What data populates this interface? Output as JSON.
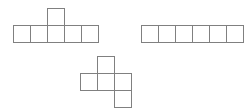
{
  "figure": {
    "title": "",
    "background_color": "#ffffff",
    "stroke_color": "#808080",
    "fill_color": "#ffffff",
    "stroke_width_px": 1,
    "cell_size_px": 17,
    "canvas": {
      "width": 249,
      "height": 112
    },
    "shapes": [
      {
        "id": "shape-1",
        "name": "five-in-a-row-with-one-on-top-of-center",
        "square_count": 6,
        "origin": {
          "x": 13,
          "y": 8
        },
        "grid_cols": 5,
        "grid_rows": 2,
        "cells": [
          {
            "col": 2,
            "row": 0
          },
          {
            "col": 0,
            "row": 1
          },
          {
            "col": 1,
            "row": 1
          },
          {
            "col": 2,
            "row": 1
          },
          {
            "col": 3,
            "row": 1
          },
          {
            "col": 4,
            "row": 1
          }
        ]
      },
      {
        "id": "shape-2",
        "name": "six-in-a-straight-row",
        "square_count": 6,
        "origin": {
          "x": 141,
          "y": 25
        },
        "grid_cols": 6,
        "grid_rows": 1,
        "cells": [
          {
            "col": 0,
            "row": 0
          },
          {
            "col": 1,
            "row": 0
          },
          {
            "col": 2,
            "row": 0
          },
          {
            "col": 3,
            "row": 0
          },
          {
            "col": 4,
            "row": 0
          },
          {
            "col": 5,
            "row": 0
          }
        ]
      },
      {
        "id": "shape-3",
        "name": "staircase-z-shaped-hexomino",
        "square_count": 5,
        "origin": {
          "x": 80,
          "y": 56
        },
        "grid_cols": 3,
        "grid_rows": 3,
        "cells": [
          {
            "col": 1,
            "row": 0
          },
          {
            "col": 0,
            "row": 1
          },
          {
            "col": 1,
            "row": 1
          },
          {
            "col": 2,
            "row": 1
          },
          {
            "col": 2,
            "row": 2
          }
        ]
      }
    ]
  }
}
